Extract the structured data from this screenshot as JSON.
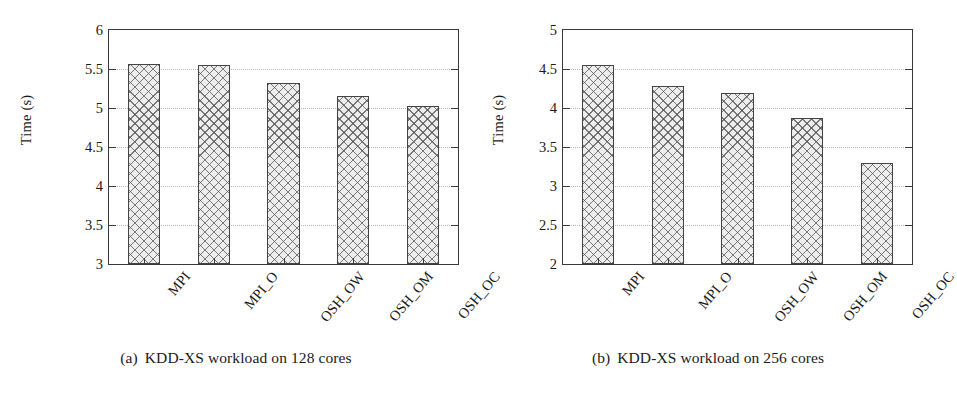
{
  "figure": {
    "background": "#ffffff",
    "bar_fill": "#ededed",
    "bar_edge": "#444444",
    "axis_color": "#3a3a3a",
    "grid_color": "#b9b9b9"
  },
  "panels": [
    {
      "id": "panel-a",
      "caption_tag": "(a)",
      "caption_text": "KDD-XS workload on 128 cores",
      "ylabel": "Time (s)",
      "yticks": [
        "6",
        "5.5",
        "5",
        "4.5",
        "4",
        "3.5",
        "3"
      ],
      "xlabels": [
        "MPI",
        "MPI_O",
        "OSH_OW",
        "OSH_OM",
        "OSH_OC"
      ]
    },
    {
      "id": "panel-b",
      "caption_tag": "(b)",
      "caption_text": "KDD-XS workload on 256 cores",
      "ylabel": "Time (s)",
      "yticks": [
        "5",
        "4.5",
        "4",
        "3.5",
        "3",
        "2.5",
        "2"
      ],
      "xlabels": [
        "MPI",
        "MPI_O",
        "OSH_OW",
        "OSH_OM",
        "OSH_OC"
      ]
    }
  ],
  "chart_data": [
    {
      "type": "bar",
      "panel": "(a)",
      "title": "(a) KDD-XS workload on 128 cores",
      "categories": [
        "MPI",
        "MPI_O",
        "OSH_OW",
        "OSH_OM",
        "OSH_OC"
      ],
      "values": [
        5.56,
        5.55,
        5.32,
        5.16,
        5.02
      ],
      "xlabel": "",
      "ylabel": "Time (s)",
      "ylim": [
        3,
        6
      ],
      "ytick_values": [
        3,
        3.5,
        4,
        4.5,
        5,
        5.5,
        6
      ],
      "grid": "horizontal-dotted",
      "legend": null
    },
    {
      "type": "bar",
      "panel": "(b)",
      "title": "(b) KDD-XS workload on 256 cores",
      "categories": [
        "MPI",
        "MPI_O",
        "OSH_OW",
        "OSH_OM",
        "OSH_OC"
      ],
      "values": [
        4.55,
        4.28,
        4.19,
        3.87,
        3.29
      ],
      "xlabel": "",
      "ylabel": "Time (s)",
      "ylim": [
        2,
        5
      ],
      "ytick_values": [
        2,
        2.5,
        3,
        3.5,
        4,
        4.5,
        5
      ],
      "grid": "horizontal-dotted",
      "legend": null
    }
  ]
}
